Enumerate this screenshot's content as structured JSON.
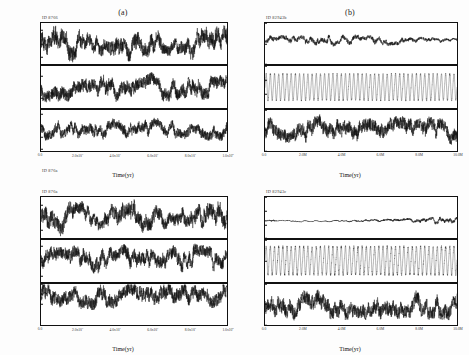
{
  "figure": {
    "background": "#ffffff",
    "trace_color": "#0d0d0d",
    "xlabel": "Time(yr)"
  },
  "chart_data": {
    "type": "line",
    "xlabel": "Time(yr)",
    "grid": false,
    "legend": false,
    "panels": [
      {
        "key": "a",
        "label": "(a)",
        "run_id_top": "ID 8766",
        "run_id_bottom": "ID 876a",
        "position": "top-left",
        "x": {
          "min": 0,
          "max": 10000000,
          "ticks": [
            0,
            2000000,
            4000000,
            6000000,
            8000000,
            10000000
          ],
          "tick_labels": [
            "0.0",
            "2.0x10",
            "4.0x10",
            "6.0x10",
            "8.0x10",
            "1.0x10"
          ],
          "tick_exponents": [
            "",
            "7",
            "7",
            "7",
            "7",
            "8"
          ]
        },
        "subplots": [
          {
            "ylabel": "i",
            "ylim": [
              0.39,
              0.57
            ],
            "yticks": [
              0.54,
              0.48,
              0.42
            ],
            "ytick_labels": [
              "0.54",
              "0.48",
              "0.42"
            ],
            "mean": 0.485,
            "amplitude": 0.055,
            "noise": 0.03,
            "character": "chaotic-bursty"
          },
          {
            "ylabel": "e",
            "ylim": [
              -0.005,
              0.105
            ],
            "yticks": [
              0.08,
              0.02
            ],
            "ytick_labels": [
              "0.08",
              "0.02"
            ],
            "mean": 0.046,
            "amplitude": 0.028,
            "noise": 0.016,
            "character": "chaotic"
          },
          {
            "ylabel": "a",
            "ylim": [
              -0.01,
              0.17
            ],
            "yticks": [
              0.15,
              0.1,
              0.05,
              0.0
            ],
            "ytick_labels": [
              "0.15",
              "0.10",
              "0.05",
              "0.00"
            ],
            "mean": 0.085,
            "amplitude": 0.038,
            "noise": 0.02,
            "character": "chaotic"
          }
        ]
      },
      {
        "key": "b",
        "label": "(b)",
        "run_id_top": "ID 82943b",
        "run_id_bottom": "ID 82943c",
        "position": "top-right",
        "x": {
          "min": 0,
          "max": 10000000,
          "ticks": [
            0,
            2000000,
            4000000,
            6000000,
            8000000,
            10000000
          ],
          "tick_labels": [
            "0.0",
            "2.0M",
            "4.0M",
            "6.0M",
            "8.0M",
            "10.0M"
          ],
          "tick_exponents": [
            "",
            "",
            "",
            "",
            "",
            ""
          ]
        },
        "subplots": [
          {
            "ylabel": "i",
            "ylim": [
              0.0,
              1.0
            ],
            "yticks": [
              1.0,
              0.5,
              0.0
            ],
            "ytick_labels": [
              "1.0",
              "0.5",
              "0.0"
            ],
            "mean": 0.57,
            "amplitude": 0.14,
            "noise": 0.05,
            "character": "damping-envelope"
          },
          {
            "ylabel": "e",
            "ylim": [
              0.0,
              0.45
            ],
            "yticks": [
              0.45,
              0.3,
              0.15,
              0.0
            ],
            "ytick_labels": [
              "0.45",
              "0.30",
              "0.15",
              "0.00"
            ],
            "mean": 0.22,
            "amplitude": 0.17,
            "noise": 0.02,
            "character": "beat-modulated"
          },
          {
            "ylabel": "a",
            "ylim": [
              0.15,
              0.17
            ],
            "yticks": [
              0.17,
              0.16,
              0.15
            ],
            "ytick_labels": [
              "0.17",
              "0.16",
              "0.15"
            ],
            "mean": 0.16,
            "amplitude": 0.005,
            "noise": 0.003,
            "character": "chaotic"
          }
        ]
      },
      {
        "key": "c",
        "label": "",
        "run_id_top": "ID 876a",
        "run_id_bottom": "",
        "position": "bottom-left",
        "x": {
          "min": 0,
          "max": 10000000,
          "ticks": [
            0,
            2000000,
            4000000,
            6000000,
            8000000,
            10000000
          ],
          "tick_labels": [
            "0.0",
            "2.0x10",
            "4.0x10",
            "6.0x10",
            "8.0x10",
            "1.0x10"
          ],
          "tick_exponents": [
            "",
            "7",
            "7",
            "7",
            "7",
            "8"
          ]
        },
        "subplots": [
          {
            "ylabel": "i",
            "ylim": [
              0.72,
              0.82
            ],
            "yticks": [
              0.8,
              0.74
            ],
            "ytick_labels": [
              "0.80",
              "0.74"
            ],
            "mean": 0.772,
            "amplitude": 0.03,
            "noise": 0.016,
            "character": "chaotic-bursty"
          },
          {
            "ylabel": "e",
            "ylim": [
              0.18,
              0.32
            ],
            "yticks": [
              0.3,
              0.26,
              0.2
            ],
            "ytick_labels": [
              "0.30",
              "0.26",
              "0.20"
            ],
            "mean": 0.256,
            "amplitude": 0.04,
            "noise": 0.02,
            "character": "chaotic"
          },
          {
            "ylabel": "a",
            "ylim": [
              0.115,
              0.135
            ],
            "yticks": [
              0.135,
              0.13,
              0.125
            ],
            "ytick_labels": [
              "0.135",
              "0.130",
              "0.125"
            ],
            "mean": 0.1295,
            "amplitude": 0.005,
            "noise": 0.003,
            "character": "chaotic"
          }
        ]
      },
      {
        "key": "d",
        "label": "",
        "run_id_top": "ID 82943c",
        "run_id_bottom": "",
        "position": "bottom-right",
        "x": {
          "min": 0,
          "max": 10000000,
          "ticks": [
            0,
            2000000,
            4000000,
            6000000,
            8000000,
            10000000
          ],
          "tick_labels": [
            "0.0",
            "2.0M",
            "4.0M",
            "6.0M",
            "8.0M",
            "10.0M"
          ],
          "tick_exponents": [
            "",
            "",
            "",
            "",
            "",
            ""
          ]
        },
        "subplots": [
          {
            "ylabel": "i",
            "ylim": [
              0.0,
              1.5
            ],
            "yticks": [
              1.5,
              1.0,
              0.5,
              0.0
            ],
            "ytick_labels": [
              "1.5",
              "1.0",
              "0.5",
              "0.0"
            ],
            "mean": 0.62,
            "amplitude": 0.1,
            "noise": 0.04,
            "character": "growing-envelope"
          },
          {
            "ylabel": "e",
            "ylim": [
              0.45,
              0.75
            ],
            "yticks": [
              0.75,
              0.6,
              0.45
            ],
            "ytick_labels": [
              "0.75",
              "0.60",
              "0.45"
            ],
            "mean": 0.6,
            "amplitude": 0.12,
            "noise": 0.02,
            "character": "beat-modulated"
          },
          {
            "ylabel": "a",
            "ylim": [
              0.733,
              0.743
            ],
            "yticks": [
              0.743,
              0.738,
              0.733
            ],
            "ytick_labels": [
              "0.743",
              "0.738",
              "0.733"
            ],
            "mean": 0.738,
            "amplitude": 0.0028,
            "noise": 0.0016,
            "character": "chaotic"
          }
        ]
      }
    ]
  }
}
